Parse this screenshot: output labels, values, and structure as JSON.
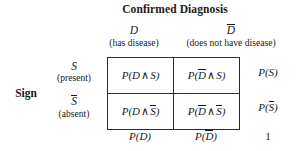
{
  "diagram": {
    "type": "contingency-probability-table",
    "column_group_title": "Confirmed Diagnosis",
    "row_group_title": "Sign",
    "columns": [
      {
        "symbol": "D",
        "symbol_overline": false,
        "description": "(has disease)"
      },
      {
        "symbol": "D",
        "symbol_overline": true,
        "description": "(does not have disease)"
      }
    ],
    "rows": [
      {
        "symbol": "S",
        "symbol_overline": false,
        "description": "(present)"
      },
      {
        "symbol": "S",
        "symbol_overline": true,
        "description": "(absent)"
      }
    ],
    "cells": [
      [
        {
          "text": "P (D  ∧ S)",
          "p": "P",
          "open": "(",
          "a": "D",
          "a_bar": false,
          "op": "∧",
          "b": "S",
          "b_bar": false,
          "close": ")"
        },
        {
          "text": "P (D̄ ∧ S)",
          "p": "P",
          "open": "(",
          "a": "D",
          "a_bar": true,
          "op": "∧",
          "b": "S",
          "b_bar": false,
          "close": ")"
        }
      ],
      [
        {
          "text": "P (D  ∧ S̄)",
          "p": "P",
          "open": "(",
          "a": "D",
          "a_bar": false,
          "op": "∧",
          "b": "S",
          "b_bar": true,
          "close": ")"
        },
        {
          "text": "P (D̄ ∧ S̄)",
          "p": "P",
          "open": "(",
          "a": "D",
          "a_bar": true,
          "op": "∧",
          "b": "S",
          "b_bar": true,
          "close": ")"
        }
      ]
    ],
    "row_margins": [
      {
        "text": "P (S)",
        "p": "P",
        "arg": "S",
        "arg_bar": false
      },
      {
        "text": "P (S̄)",
        "p": "P",
        "arg": "S",
        "arg_bar": true
      }
    ],
    "column_margins": [
      {
        "text": "P (D)",
        "p": "P",
        "arg": "D",
        "arg_bar": false
      },
      {
        "text": "P (D̄)",
        "p": "P",
        "arg": "D",
        "arg_bar": true
      }
    ],
    "grand_total": "1",
    "symbols": {
      "conjunction": "∧",
      "paren_open": "(",
      "paren_close": ")",
      "probability_fn": "P"
    },
    "colors": {
      "background": "#ffffff",
      "text": "#1a1a1a",
      "border": "#2b2b2b"
    }
  }
}
